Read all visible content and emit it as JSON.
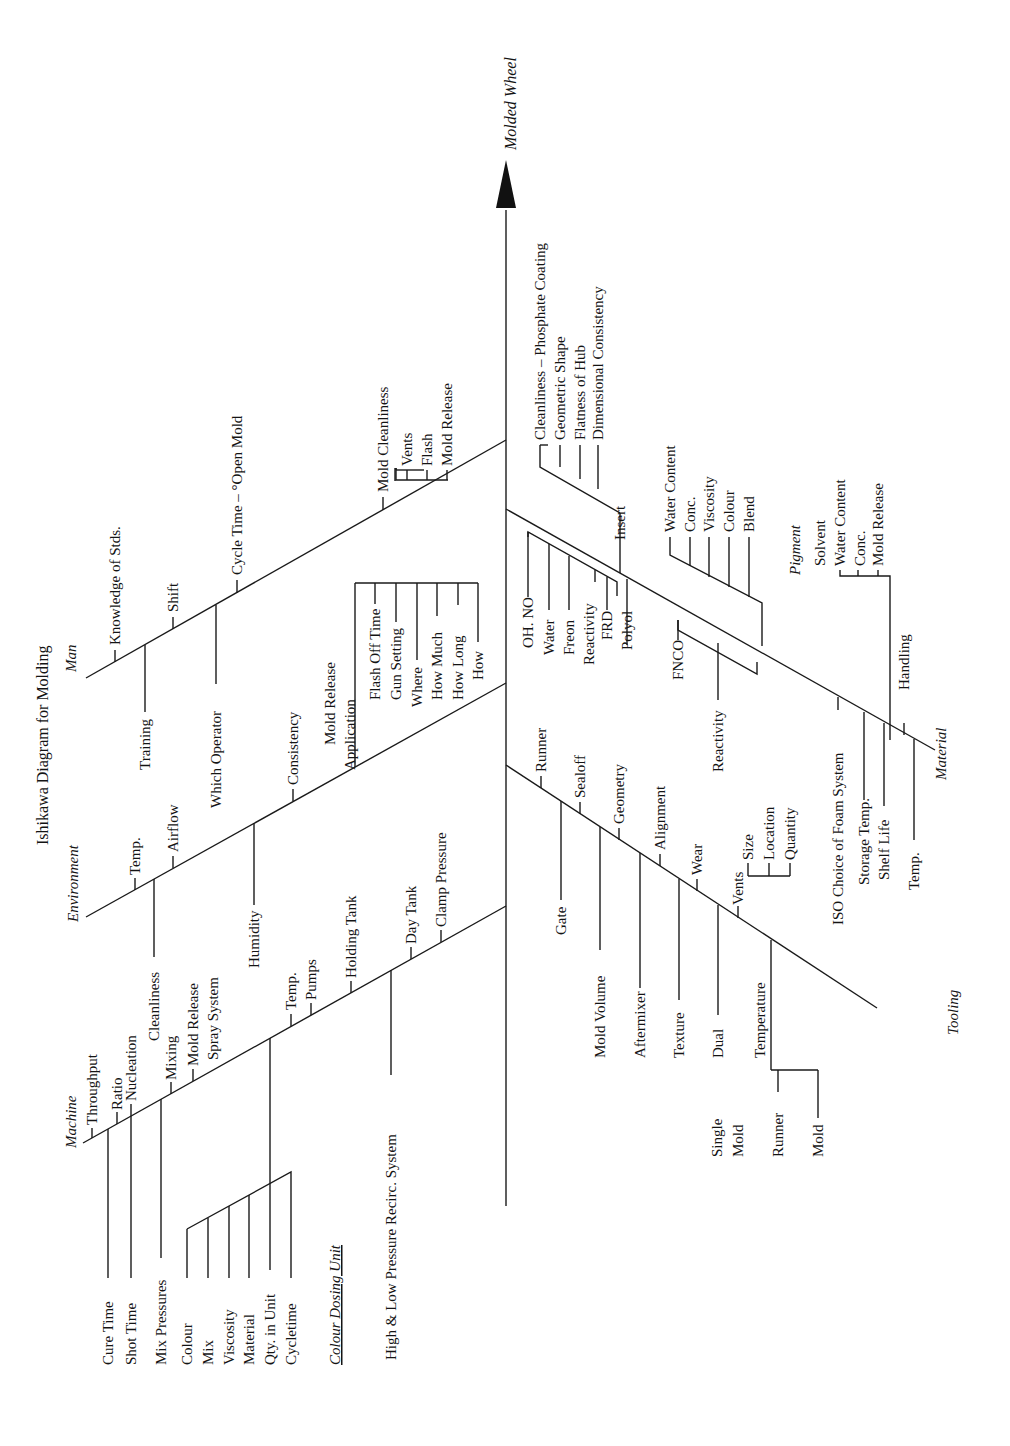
{
  "title": "Ishikawa Diagram for Molding",
  "effect": "Molded Wheel",
  "categories": {
    "man": {
      "label": "Man",
      "causes": [
        "Knowledge of Stds.",
        "Training",
        "Shift",
        "Which Operator",
        "Cycle Time – °Open Mold",
        "Mold Cleanliness"
      ],
      "mold_cleanliness_sub": [
        "Vents",
        "Flash",
        "Mold Release"
      ]
    },
    "environment": {
      "label": "Environment",
      "causes": [
        "Temp.",
        "Cleanliness",
        "Airflow",
        "Humidity",
        "Consistency"
      ],
      "mold_release_application": {
        "label_line1": "Mold Release",
        "label_line2": "Application",
        "sub": [
          "Flash Off Time",
          "Gun Setting",
          "Where",
          "How Much",
          "How Long",
          "How"
        ]
      }
    },
    "machine": {
      "label": "Machine",
      "causes": [
        "Throughput",
        "Ratio",
        "Nucleation",
        "Cure Time",
        "Shot Time",
        "Mix Pressures",
        "Mixing",
        "Mold Release",
        "Spray System",
        "Temp.",
        "Pumps",
        "Holding Tank",
        "High & Low Pressure Recirc. System",
        "Day Tank",
        "Clamp Pressure"
      ],
      "colour_dosing_unit": {
        "label": "Colour Dosing Unit",
        "sub": [
          "Colour",
          "Mix",
          "Viscosity",
          "Material",
          "Qty. in Unit",
          "Cycletime"
        ]
      }
    },
    "tooling": {
      "label": "Tooling",
      "causes": [
        "Runner",
        "Gate",
        "Sealoff",
        "Mold Volume",
        "Geometry",
        "Aftermixer",
        "Alignment",
        "Texture",
        "Wear",
        "Dual",
        "Vents",
        "Temperature"
      ],
      "vents_sub": [
        "Size",
        "Location",
        "Quantity"
      ],
      "temperature_sub": [
        "Runner",
        "Mold"
      ],
      "dual_alt_line1": "Single",
      "dual_alt_line2": "Mold"
    },
    "material": {
      "label": "Material",
      "causes": [
        "Insert",
        "Polyol",
        "FNCO",
        "Reactivity",
        "ISO Choice of Foam System",
        "Storage Temp.",
        "Shelf Life",
        "Handling",
        "Temp."
      ],
      "insert_sub": [
        "Cleanliness – Phosphate Coating",
        "Geometric Shape",
        "Flatness of Hub",
        "Dimensional Consistency"
      ],
      "polyol_sub": [
        "OH. NO",
        "Water",
        "Freon",
        "Reactivity",
        "FRD"
      ],
      "pigment": {
        "label": "Pigment",
        "sub": [
          "Water Content",
          "Conc.",
          "Viscosity",
          "Colour",
          "Blend"
        ]
      },
      "mold_release_sub": {
        "label": "Mold Release",
        "sub": [
          "Solvent",
          "Water Content",
          "Conc."
        ]
      }
    }
  }
}
